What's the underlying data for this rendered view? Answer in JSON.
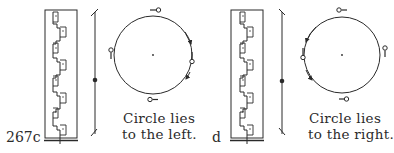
{
  "figure": {
    "number": "267",
    "panels": [
      {
        "id": "c",
        "label": "267c",
        "caption_line1": "Circle lies",
        "caption_line2": "to the left.",
        "circle_side": "left",
        "rotation": "clockwise"
      },
      {
        "id": "d",
        "label": "d",
        "caption_line1": "Circle lies",
        "caption_line2": "to the right.",
        "circle_side": "right",
        "rotation": "counterclockwise"
      }
    ]
  },
  "style": {
    "ink": "#2a2a2a",
    "background": "#ffffff"
  }
}
